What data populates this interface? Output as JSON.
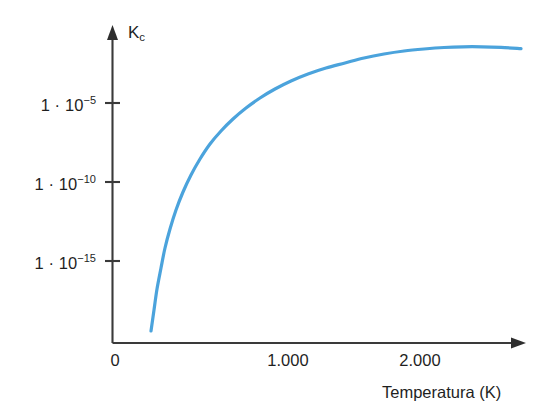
{
  "chart_data": {
    "type": "line",
    "title": "",
    "xlabel": "Temperatura (K)",
    "ylabel": "K",
    "ylabel_sub": "c",
    "xlim": [
      0,
      2400
    ],
    "ylim_log10": [
      -18.4,
      -0.6
    ],
    "grid": false,
    "legend": null,
    "x_ticks": [
      {
        "value": 0,
        "label": "0"
      },
      {
        "value": 1000,
        "label": "1.000"
      },
      {
        "value": 2000,
        "label": "2.000"
      }
    ],
    "y_ticks": [
      {
        "mantissa": "1 · 10",
        "exponent": "−5",
        "value_log10": -5
      },
      {
        "mantissa": "1 · 10",
        "exponent": "−10",
        "value_log10": -10
      },
      {
        "mantissa": "1 · 10",
        "exponent": "−15",
        "value_log10": -15
      }
    ],
    "series": [
      {
        "name": "Kc vs Temperatura",
        "color": "#4ba3dc",
        "line_width": 3.2,
        "points_px": [
          [
            151,
            331
          ],
          [
            154,
            310
          ],
          [
            157,
            289
          ],
          [
            161,
            268
          ],
          [
            165,
            248
          ],
          [
            170,
            229
          ],
          [
            176,
            210
          ],
          [
            183,
            192
          ],
          [
            191,
            175
          ],
          [
            200,
            159
          ],
          [
            210,
            144
          ],
          [
            221,
            131
          ],
          [
            233,
            119
          ],
          [
            246,
            108
          ],
          [
            260,
            98
          ],
          [
            275,
            89
          ],
          [
            291,
            81
          ],
          [
            308,
            74
          ],
          [
            326,
            68
          ],
          [
            345,
            63
          ],
          [
            364,
            58
          ],
          [
            384,
            54
          ],
          [
            404,
            51
          ],
          [
            424,
            49
          ],
          [
            444,
            47.5
          ],
          [
            463,
            46.8
          ],
          [
            482,
            46.8
          ],
          [
            501,
            47.4
          ],
          [
            521,
            48.6
          ]
        ],
        "data_points": [
          {
            "x": 225,
            "y_log10": -18.05
          },
          {
            "x": 250,
            "y_log10": -16.7
          },
          {
            "x": 300,
            "y_log10": -14.5
          },
          {
            "x": 400,
            "y_log10": -11.5
          },
          {
            "x": 500,
            "y_log10": -9.4
          },
          {
            "x": 600,
            "y_log10": -7.9
          },
          {
            "x": 700,
            "y_log10": -6.7
          },
          {
            "x": 800,
            "y_log10": -5.8
          },
          {
            "x": 1000,
            "y_log10": -4.4
          },
          {
            "x": 1200,
            "y_log10": -3.4
          },
          {
            "x": 1400,
            "y_log10": -2.7
          },
          {
            "x": 1600,
            "y_log10": -2.15
          },
          {
            "x": 1800,
            "y_log10": -1.75
          },
          {
            "x": 2000,
            "y_log10": -1.5
          },
          {
            "x": 2200,
            "y_log10": -1.4
          },
          {
            "x": 2400,
            "y_log10": -1.45
          }
        ]
      }
    ]
  },
  "axes": {
    "y_axis_title": "K",
    "y_axis_title_sub": "c",
    "x_axis_title": "Temperatura (K)",
    "x_tick_labels": [
      "0",
      "1.000",
      "2.000"
    ],
    "y_tick_labels": [
      {
        "base": "1 · 10",
        "exp": "−5"
      },
      {
        "base": "1 · 10",
        "exp": "−10"
      },
      {
        "base": "1 · 10",
        "exp": "−15"
      }
    ]
  },
  "style": {
    "background": "#ffffff",
    "axis_color": "#3a3a3a",
    "text_color": "#1f1f1f",
    "curve_color": "#4ba3dc"
  }
}
